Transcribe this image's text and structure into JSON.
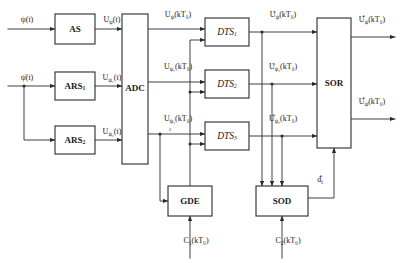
{
  "diagram": {
    "type": "block-diagram",
    "blocks": [
      {
        "id": "as",
        "label": "AS",
        "style": "bold",
        "x": 55,
        "y": 14,
        "w": 40,
        "h": 30
      },
      {
        "id": "ars1",
        "label": "ARS",
        "sub": "1",
        "style": "bold",
        "x": 55,
        "y": 72,
        "w": 40,
        "h": 28
      },
      {
        "id": "ars2",
        "label": "ARS",
        "sub": "2",
        "style": "bold",
        "x": 55,
        "y": 126,
        "w": 40,
        "h": 28
      },
      {
        "id": "adc",
        "label": "ADC",
        "style": "bold",
        "x": 122,
        "y": 14,
        "w": 26,
        "h": 150
      },
      {
        "id": "dts1",
        "label": "DTS",
        "sub": "1",
        "style": "italic",
        "x": 205,
        "y": 18,
        "w": 44,
        "h": 28
      },
      {
        "id": "dts2",
        "label": "DTS",
        "sub": "2",
        "style": "italic",
        "x": 205,
        "y": 70,
        "w": 44,
        "h": 28
      },
      {
        "id": "dts3",
        "label": "DTS",
        "sub": "3",
        "style": "italic",
        "x": 205,
        "y": 122,
        "w": 44,
        "h": 28
      },
      {
        "id": "sor",
        "label": "SOR",
        "style": "bold",
        "x": 317,
        "y": 18,
        "w": 34,
        "h": 130
      },
      {
        "id": "gde",
        "label": "GDE",
        "style": "bold",
        "x": 168,
        "y": 186,
        "w": 44,
        "h": 30
      },
      {
        "id": "sod",
        "label": "SOD",
        "style": "bold",
        "x": 256,
        "y": 186,
        "w": 52,
        "h": 30
      }
    ],
    "signals": [
      {
        "id": "in-psi",
        "base": "ψ(t)",
        "x": 27,
        "y": 22
      },
      {
        "id": "in-psidot",
        "base": "ψ̇(t)",
        "x": 27,
        "y": 80
      },
      {
        "id": "u-psi-t",
        "base": "U",
        "sub": "ψ",
        "tail": "(t)",
        "accent": "none",
        "x": 112,
        "y": 22
      },
      {
        "id": "u-psi1-t",
        "base": "U",
        "sub": "ψ₁",
        "tail": "(t)",
        "accent": "none",
        "x": 112,
        "y": 80
      },
      {
        "id": "u-psi2-t",
        "base": "U",
        "sub": "ψ₂",
        "tail": "(t)",
        "accent": "none",
        "x": 112,
        "y": 134
      },
      {
        "id": "u-psi-k",
        "base": "U",
        "sub": "ψ",
        "tail": "(kT₀)",
        "accent": "none",
        "x": 178,
        "y": 17
      },
      {
        "id": "u-psi1-k",
        "base": "U",
        "sub": "ψ₁",
        "tail": "(kT₀)",
        "accent": "none",
        "x": 178,
        "y": 69
      },
      {
        "id": "u-psi2-k",
        "base": "U",
        "sub": "ψ₂",
        "tail": "(kT₀)",
        "accent": "none",
        "x": 178,
        "y": 121
      },
      {
        "id": "ut-psi-k",
        "base": "U",
        "sub": "ψ",
        "tail": "(kT₀)",
        "accent": "tilde",
        "x": 283,
        "y": 17
      },
      {
        "id": "ut-psi1-k",
        "base": "U",
        "sub": "ψ₁",
        "tail": "(kT₀)",
        "accent": "tilde",
        "x": 283,
        "y": 69
      },
      {
        "id": "uh-psi2-k",
        "base": "U",
        "sub": "ψ₂",
        "tail": "(kT₀)",
        "accent": "hat",
        "x": 283,
        "y": 121
      },
      {
        "id": "out-psi",
        "base": "U",
        "sub": "ψ",
        "tail": "(kT₀)",
        "accent": "hat",
        "x": 372,
        "y": 22
      },
      {
        "id": "out-psidot",
        "base": "U",
        "sub": "ψ̇",
        "tail": "(kT₀)",
        "accent": "hat",
        "x": 372,
        "y": 104
      },
      {
        "id": "d-hat",
        "base": "d",
        "sub": "i",
        "accent": "hat",
        "x": 320,
        "y": 182
      },
      {
        "id": "c1",
        "base": "C",
        "sub": "1",
        "tail": "(kT₀)",
        "accent": "none",
        "x": 196,
        "y": 243
      },
      {
        "id": "c2",
        "base": "C",
        "sub": "2",
        "tail": "(kT₀)",
        "accent": "none",
        "x": 288,
        "y": 243
      },
      {
        "id": "mark-one",
        "base": "1",
        "accent": "none",
        "x": 170,
        "y": 131
      }
    ]
  }
}
